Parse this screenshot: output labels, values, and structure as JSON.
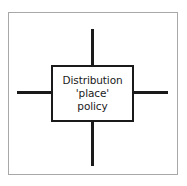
{
  "figure": {
    "type": "cross-diagram",
    "frame_color": "#a8a8a8",
    "line_color": "#1a1a1a",
    "background_color": "#ffffff",
    "center_box": {
      "lines": [
        "Distribution",
        "'place'",
        "policy"
      ]
    },
    "arms": [
      {
        "name": "top",
        "label": ""
      },
      {
        "name": "right",
        "label": ""
      },
      {
        "name": "bottom",
        "label": ""
      },
      {
        "name": "left",
        "label": ""
      }
    ]
  }
}
